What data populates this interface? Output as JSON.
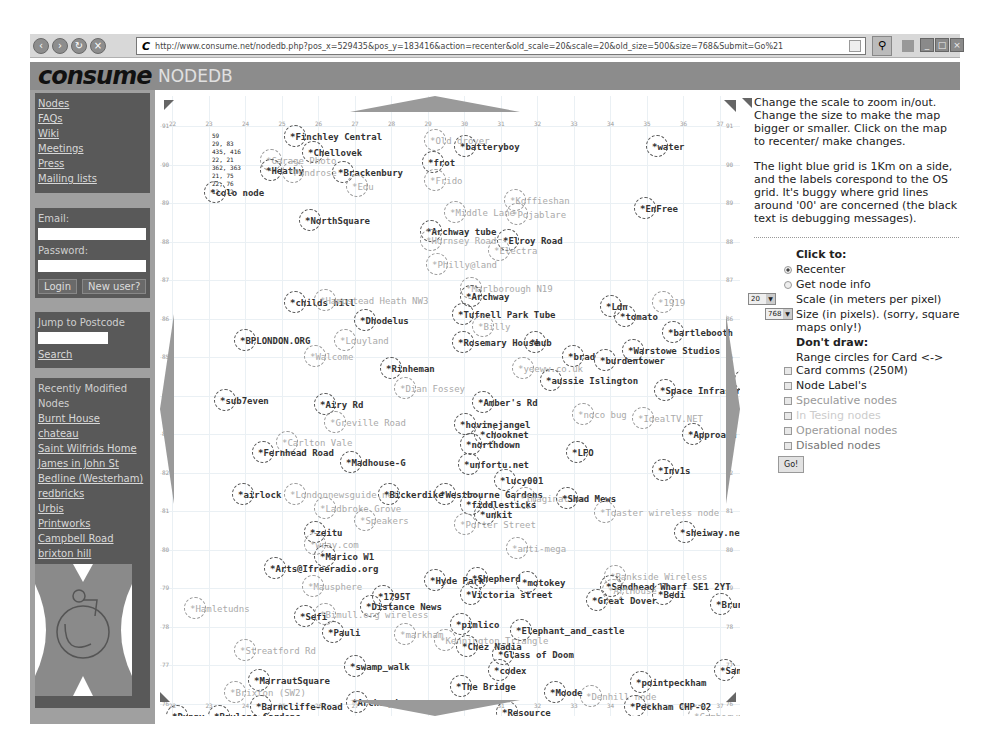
{
  "browser": {
    "url": "http://www.consume.net/nodedb.php?pos_x=529435&pos_y=183416&action=recenter&old_scale=20&scale=20&old_size=500&size=768&Submit=Go%21",
    "url_prefix": "C"
  },
  "header": {
    "logo": "consume",
    "title": "NODEDB"
  },
  "sidebar": {
    "nav": [
      "Nodes",
      "FAQs",
      "Wiki",
      "Meetings",
      "Press",
      "Mailing lists"
    ],
    "login": {
      "email_label": "Email:",
      "password_label": "Password:",
      "login_btn": "Login",
      "new_user_btn": "New user?"
    },
    "postcode": {
      "label": "Jump to Postcode",
      "search": "Search"
    },
    "recent": {
      "heading": "Recently Modified Nodes",
      "items": [
        "Burnt House",
        "chateau",
        "Saint Wilfrids Home",
        "James in John St",
        "Bedline (Westerham)",
        "redbricks",
        "Urbis",
        "Printworks",
        "Campbell Road",
        "brixton hill"
      ]
    }
  },
  "map": {
    "debug": "59\n29, 83\n435, 416\n22, 21\n362, 363\n21, 75\n22, 76\n12, 12",
    "x_ticks": [
      "22",
      "23",
      "24",
      "25",
      "26",
      "27",
      "28",
      "29",
      "30",
      "31",
      "32",
      "33",
      "34",
      "35",
      "36",
      "37"
    ],
    "y_ticks": [
      "91",
      "90",
      "89",
      "88",
      "87",
      "86",
      "85",
      "84",
      "83",
      "82",
      "81",
      "80",
      "79",
      "78",
      "77",
      "76"
    ],
    "nodes": [
      {
        "label": "*Finchley Central",
        "x": 130,
        "y": 36,
        "t": "op"
      },
      {
        "label": "*Chellovek",
        "x": 148,
        "y": 52,
        "t": "op"
      },
      {
        "label": "*Old drover",
        "x": 270,
        "y": 40,
        "t": "spec"
      },
      {
        "label": "*batteryboy",
        "x": 300,
        "y": 46,
        "t": "op"
      },
      {
        "label": "*water",
        "x": 492,
        "y": 46,
        "t": "op"
      },
      {
        "label": "*Garage Photo",
        "x": 106,
        "y": 60,
        "t": "spec"
      },
      {
        "label": "*Heathy",
        "x": 106,
        "y": 70,
        "t": "op"
      },
      {
        "label": "*Pondrose",
        "x": 128,
        "y": 72,
        "t": "spec"
      },
      {
        "label": "*Brackenbury",
        "x": 178,
        "y": 72,
        "t": "op"
      },
      {
        "label": "*frot",
        "x": 268,
        "y": 62,
        "t": "op"
      },
      {
        "label": "*Edu",
        "x": 192,
        "y": 86,
        "t": "spec"
      },
      {
        "label": "*Frido",
        "x": 270,
        "y": 80,
        "t": "spec"
      },
      {
        "label": "*colo node",
        "x": 50,
        "y": 92,
        "t": "op"
      },
      {
        "label": "*Koffieshan",
        "x": 350,
        "y": 100,
        "t": "spec"
      },
      {
        "label": "*EnFree",
        "x": 480,
        "y": 108,
        "t": "op"
      },
      {
        "label": "*Middle Lane",
        "x": 290,
        "y": 112,
        "t": "spec"
      },
      {
        "label": "*Pojablare",
        "x": 352,
        "y": 114,
        "t": "spec"
      },
      {
        "label": "*NorthSquare",
        "x": 145,
        "y": 120,
        "t": "op"
      },
      {
        "label": "*Archway tube",
        "x": 266,
        "y": 131,
        "t": "op"
      },
      {
        "label": "*Hornsey Road",
        "x": 266,
        "y": 140,
        "t": "spec"
      },
      {
        "label": "*Elroy Road",
        "x": 343,
        "y": 140,
        "t": "op"
      },
      {
        "label": "*Electra",
        "x": 334,
        "y": 150,
        "t": "spec"
      },
      {
        "label": "*Philly@land",
        "x": 272,
        "y": 164,
        "t": "spec"
      },
      {
        "label": "*Marlborough N19",
        "x": 306,
        "y": 188,
        "t": "spec"
      },
      {
        "label": "*Archway",
        "x": 306,
        "y": 196,
        "t": "op"
      },
      {
        "label": "*childs hill",
        "x": 130,
        "y": 202,
        "t": "op"
      },
      {
        "label": "*Hampstead Heath NW3",
        "x": 160,
        "y": 200,
        "t": "spec"
      },
      {
        "label": "*Tufnell Park Tube",
        "x": 298,
        "y": 214,
        "t": "op"
      },
      {
        "label": "*Dhodelus",
        "x": 200,
        "y": 220,
        "t": "op"
      },
      {
        "label": "*Ldn",
        "x": 446,
        "y": 206,
        "t": "op"
      },
      {
        "label": "*tomato",
        "x": 460,
        "y": 216,
        "t": "op"
      },
      {
        "label": "*1919",
        "x": 498,
        "y": 202,
        "t": "spec"
      },
      {
        "label": "*Billy",
        "x": 318,
        "y": 226,
        "t": "spec"
      },
      {
        "label": "*bartlebooth",
        "x": 508,
        "y": 232,
        "t": "op"
      },
      {
        "label": "*BPLONDON.ORG",
        "x": 80,
        "y": 240,
        "t": "op"
      },
      {
        "label": "*Louyland",
        "x": 180,
        "y": 240,
        "t": "spec"
      },
      {
        "label": "*Rosemary House",
        "x": 298,
        "y": 242,
        "t": "op"
      },
      {
        "label": "*hub",
        "x": 370,
        "y": 242,
        "t": "op"
      },
      {
        "label": "*Warstowe Studios",
        "x": 468,
        "y": 250,
        "t": "op"
      },
      {
        "label": "*Walcome",
        "x": 150,
        "y": 256,
        "t": "spec"
      },
      {
        "label": "*brad",
        "x": 408,
        "y": 256,
        "t": "op"
      },
      {
        "label": "*burdentower",
        "x": 440,
        "y": 260,
        "t": "op"
      },
      {
        "label": "*yeeww.co.uk",
        "x": 358,
        "y": 268,
        "t": "spec"
      },
      {
        "label": "*Rinheman",
        "x": 226,
        "y": 268,
        "t": "op"
      },
      {
        "label": "*aussie Islington",
        "x": 386,
        "y": 280,
        "t": "op"
      },
      {
        "label": "*Well5tCo",
        "x": 580,
        "y": 280,
        "t": "op"
      },
      {
        "label": "*Dian Fossey",
        "x": 240,
        "y": 288,
        "t": "spec"
      },
      {
        "label": "*Space Infrastr",
        "x": 500,
        "y": 290,
        "t": "op"
      },
      {
        "label": "*sub7even",
        "x": 60,
        "y": 300,
        "t": "op"
      },
      {
        "label": "*Airy Rd",
        "x": 160,
        "y": 304,
        "t": "op"
      },
      {
        "label": "*Amber's Rd",
        "x": 318,
        "y": 302,
        "t": "op"
      },
      {
        "label": "*noco bug",
        "x": 418,
        "y": 314,
        "t": "spec"
      },
      {
        "label": "*Greville Road",
        "x": 170,
        "y": 322,
        "t": "spec"
      },
      {
        "label": "*hovinejangel",
        "x": 300,
        "y": 324,
        "t": "op"
      },
      {
        "label": "*chooknet",
        "x": 320,
        "y": 334,
        "t": "op"
      },
      {
        "label": "*IdealTV.NET",
        "x": 478,
        "y": 318,
        "t": "spec"
      },
      {
        "label": "*Approach Rd",
        "x": 528,
        "y": 334,
        "t": "op"
      },
      {
        "label": "*northdown",
        "x": 306,
        "y": 344,
        "t": "op"
      },
      {
        "label": "*Carlton Vale",
        "x": 122,
        "y": 342,
        "t": "spec"
      },
      {
        "label": "*Fernhead Road",
        "x": 98,
        "y": 352,
        "t": "op"
      },
      {
        "label": "*LFO",
        "x": 412,
        "y": 352,
        "t": "op"
      },
      {
        "label": "*Madhouse-G",
        "x": 186,
        "y": 362,
        "t": "op"
      },
      {
        "label": "*unfortu.net",
        "x": 304,
        "y": 364,
        "t": "op"
      },
      {
        "label": "*Inv1s",
        "x": 498,
        "y": 370,
        "t": "op"
      },
      {
        "label": "*lucy001",
        "x": 340,
        "y": 380,
        "t": "op"
      },
      {
        "label": "*airlock",
        "x": 78,
        "y": 394,
        "t": "op"
      },
      {
        "label": "*Londonnewsguide.net",
        "x": 130,
        "y": 394,
        "t": "spec"
      },
      {
        "label": "*Bickerdike",
        "x": 224,
        "y": 394,
        "t": "op"
      },
      {
        "label": "*Westbourne Gardens",
        "x": 280,
        "y": 394,
        "t": "op"
      },
      {
        "label": "*Ladbroke Grove",
        "x": 160,
        "y": 408,
        "t": "spec"
      },
      {
        "label": "*fiddlesticks",
        "x": 306,
        "y": 404,
        "t": "op"
      },
      {
        "label": "*Imagination",
        "x": 360,
        "y": 398,
        "t": "spec"
      },
      {
        "label": "*Shad Mews",
        "x": 402,
        "y": 398,
        "t": "op"
      },
      {
        "label": "*Toaster wireless node",
        "x": 440,
        "y": 412,
        "t": "spec"
      },
      {
        "label": "*unkit",
        "x": 320,
        "y": 414,
        "t": "op"
      },
      {
        "label": "*Porter Street",
        "x": 300,
        "y": 424,
        "t": "spec"
      },
      {
        "label": "*Speakers",
        "x": 200,
        "y": 420,
        "t": "spec"
      },
      {
        "label": "*zeitu",
        "x": 150,
        "y": 432,
        "t": "op"
      },
      {
        "label": "*wray.com",
        "x": 150,
        "y": 444,
        "t": "spec"
      },
      {
        "label": "*Marico W1",
        "x": 160,
        "y": 456,
        "t": "op"
      },
      {
        "label": "*Arts@Ifreeradio.org",
        "x": 110,
        "y": 468,
        "t": "op"
      },
      {
        "label": "*anti-mega",
        "x": 352,
        "y": 448,
        "t": "spec"
      },
      {
        "label": "*sheiway.net",
        "x": 520,
        "y": 432,
        "t": "op"
      },
      {
        "label": "*Mausphere",
        "x": 148,
        "y": 486,
        "t": "spec"
      },
      {
        "label": "*Hyde Park",
        "x": 270,
        "y": 480,
        "t": "op"
      },
      {
        "label": "*Shepherd",
        "x": 312,
        "y": 478,
        "t": "op"
      },
      {
        "label": "*motokey",
        "x": 362,
        "y": 482,
        "t": "op"
      },
      {
        "label": "*Bankside Wireless",
        "x": 450,
        "y": 476,
        "t": "spec"
      },
      {
        "label": "*Sandhead Wharf SE1 2YT",
        "x": 446,
        "y": 486,
        "t": "op"
      },
      {
        "label": "*Victoria street",
        "x": 306,
        "y": 494,
        "t": "op"
      },
      {
        "label": "*Great Dover",
        "x": 432,
        "y": 500,
        "t": "op"
      },
      {
        "label": "*ArtHouse",
        "x": 448,
        "y": 490,
        "t": "spec"
      },
      {
        "label": "*Bedi",
        "x": 498,
        "y": 494,
        "t": "op"
      },
      {
        "label": "*Brunswick",
        "x": 556,
        "y": 504,
        "t": "op"
      },
      {
        "label": "*1795T",
        "x": 218,
        "y": 496,
        "t": "op"
      },
      {
        "label": "*Distance News",
        "x": 206,
        "y": 506,
        "t": "op"
      },
      {
        "label": "*Hamletudns",
        "x": 30,
        "y": 508,
        "t": "spec"
      },
      {
        "label": "*Sefi",
        "x": 140,
        "y": 516,
        "t": "op"
      },
      {
        "label": "*Bimull.org wireless",
        "x": 160,
        "y": 514,
        "t": "spec"
      },
      {
        "label": "*Pauli",
        "x": 168,
        "y": 532,
        "t": "op"
      },
      {
        "label": "*markham",
        "x": 240,
        "y": 534,
        "t": "spec"
      },
      {
        "label": "*pimlico",
        "x": 296,
        "y": 524,
        "t": "op"
      },
      {
        "label": "*Kennington Triangle",
        "x": 280,
        "y": 540,
        "t": "spec"
      },
      {
        "label": "*Elephant_and_castle",
        "x": 356,
        "y": 530,
        "t": "op"
      },
      {
        "label": "*Chez Nadia",
        "x": 302,
        "y": 546,
        "t": "op"
      },
      {
        "label": "*Glass of Doom",
        "x": 338,
        "y": 554,
        "t": "op"
      },
      {
        "label": "*Sandford",
        "x": 560,
        "y": 570,
        "t": "op"
      },
      {
        "label": "*Streatford Rd",
        "x": 80,
        "y": 550,
        "t": "spec"
      },
      {
        "label": "*swamp_walk",
        "x": 190,
        "y": 566,
        "t": "op"
      },
      {
        "label": "*codex",
        "x": 334,
        "y": 570,
        "t": "op"
      },
      {
        "label": "*pointpeckham",
        "x": 476,
        "y": 582,
        "t": "op"
      },
      {
        "label": "*MarrautSquare",
        "x": 94,
        "y": 580,
        "t": "op"
      },
      {
        "label": "*The Bridge",
        "x": 296,
        "y": 586,
        "t": "op"
      },
      {
        "label": "*Moode",
        "x": 390,
        "y": 592,
        "t": "op"
      },
      {
        "label": "*Denhill node",
        "x": 426,
        "y": 596,
        "t": "spec"
      },
      {
        "label": "*Brixton (SW2)",
        "x": 70,
        "y": 592,
        "t": "spec"
      },
      {
        "label": "*Barncliffe-Road",
        "x": 96,
        "y": 606,
        "t": "op"
      },
      {
        "label": "*Archershouse",
        "x": 192,
        "y": 602,
        "t": "op"
      },
      {
        "label": "*Resource",
        "x": 342,
        "y": 612,
        "t": "op"
      },
      {
        "label": "*Peckham CHP-02",
        "x": 470,
        "y": 606,
        "t": "op"
      },
      {
        "label": "*Dunny",
        "x": 12,
        "y": 616,
        "t": "op"
      },
      {
        "label": "*Baylons Gardens",
        "x": 54,
        "y": 616,
        "t": "op"
      },
      {
        "label": "*Camberwell",
        "x": 534,
        "y": 616,
        "t": "spec"
      }
    ]
  },
  "help": {
    "p1": "Change the scale to zoom in/out. Change the size to make the map bigger or smaller. Click on the map to recenter/ make changes.",
    "p2": "The light blue grid is 1Km on a side, and the labels corespond to the OS grid. It's buggy where grid lines around '00' are concerned (the black text is debugging messages)."
  },
  "controls": {
    "click_to": "Click to:",
    "recenter": "Recenter",
    "get_node_info": "Get node info",
    "scale_value": "20",
    "scale_label": "Scale (in meters per pixel)",
    "size_value": "768",
    "size_label": "Size (in pixels). (sorry, square maps only!)",
    "dont_draw": "Don't draw:",
    "range_circles": "Range circles for Card <-> Card comms (250M)",
    "node_labels": "Node Label's",
    "speculative": "Speculative nodes",
    "in_testing": "In Tesing nodes",
    "operational": "Operational nodes",
    "disabled": "Disabled nodes",
    "go": "Go!"
  }
}
